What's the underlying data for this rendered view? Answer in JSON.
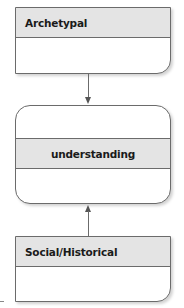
{
  "diagram": {
    "nodes": [
      {
        "id": "archetypal",
        "label": "Archetypal"
      },
      {
        "id": "understanding",
        "label": "understanding"
      },
      {
        "id": "social_historical",
        "label": "Social/Historical"
      }
    ],
    "edges": [
      {
        "from": "archetypal",
        "to": "understanding",
        "direction": "down"
      },
      {
        "from": "social_historical",
        "to": "understanding",
        "direction": "up"
      }
    ],
    "colors": {
      "header_fill": "#e4e4e4",
      "border": "#6b6b6b",
      "text": "#1a1a1a"
    }
  }
}
